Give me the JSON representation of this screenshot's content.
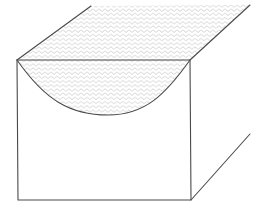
{
  "figure": {
    "shape": "rectangular prism (open top face)",
    "shaded_regions": [
      "top-face",
      "front-face-above-curve"
    ],
    "fill_pattern": "zigzag"
  },
  "colors": {
    "background": "#ffffff",
    "edge": "#4a4a4a",
    "hatch": "#c9c9c9"
  }
}
